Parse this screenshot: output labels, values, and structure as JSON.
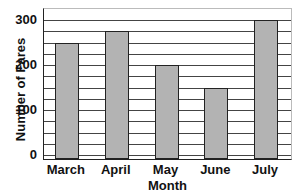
{
  "chart_data": {
    "type": "bar",
    "title": "",
    "categories": [
      "March",
      "April",
      "May",
      "June",
      "July"
    ],
    "values": [
      250,
      275,
      200,
      150,
      300
    ],
    "xlabel": "Month",
    "ylabel": "Number of Fares",
    "ylim": [
      0,
      300
    ],
    "yticks": [
      0,
      100,
      200,
      300
    ],
    "ytick_labels": [
      "0",
      "100",
      "200",
      "300"
    ],
    "grid": true,
    "grid_step": 25,
    "bar_color": "#b3b3b3",
    "edge_color": "#222222",
    "legend": null
  }
}
